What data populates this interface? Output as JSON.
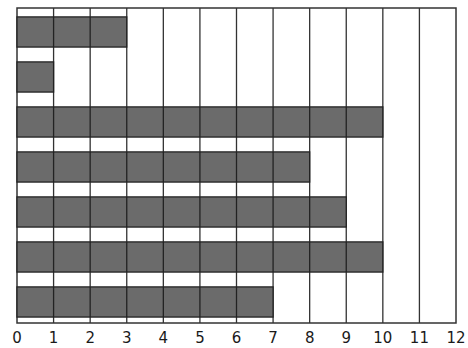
{
  "chart_data": {
    "type": "bar",
    "orientation": "horizontal",
    "title": "",
    "xlabel": "",
    "ylabel": "",
    "categories": [
      "Bar 1",
      "Bar 2",
      "Bar 3",
      "Bar 4",
      "Bar 5",
      "Bar 6",
      "Bar 7"
    ],
    "values": [
      3,
      1,
      10,
      8,
      9,
      10,
      7
    ],
    "xlim": [
      0,
      12
    ],
    "x_ticks": [
      0,
      1,
      2,
      3,
      4,
      5,
      6,
      7,
      8,
      9,
      10,
      11,
      12
    ],
    "x_tick_labels": [
      "0",
      "1",
      "2",
      "3",
      "4",
      "5",
      "6",
      "7",
      "8",
      "9",
      "10",
      "11",
      "12"
    ],
    "grid": {
      "vertical": true,
      "horizontal": false
    },
    "legend": null,
    "bar_color": "#6b6b6b",
    "gridline_color": "#333333",
    "background_color": "#ffffff"
  }
}
